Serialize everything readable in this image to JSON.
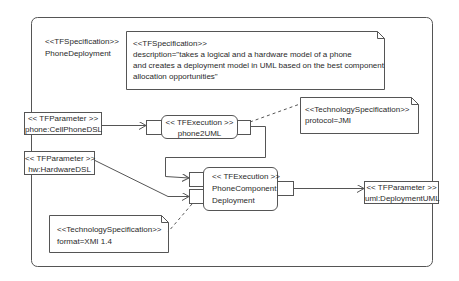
{
  "frame": {
    "stereotype": "<<TFSpecification>>",
    "name": "PhoneDeployment"
  },
  "description_note": {
    "stereotype": "<<TFSpecification>>",
    "lines": [
      "description=\"takes a logical and a hardware model of a phone",
      "and creates a deployment model in UML based on the best component",
      "allocation opportunities\""
    ]
  },
  "parameters": [
    {
      "stereotype": "<< TFParameter >>",
      "name": "phone:CellPhoneDSL"
    },
    {
      "stereotype": "<< TFParameter >>",
      "name": "hw:HardwareDSL"
    },
    {
      "stereotype": "<< TFParameter >>",
      "name": "uml:DeploymentUML"
    }
  ],
  "executions": [
    {
      "stereotype": "<< TFExecution >>",
      "lines": [
        "phone2UML"
      ]
    },
    {
      "stereotype": "<< TFExecution >>",
      "lines": [
        "PhoneComponent",
        "Deployment"
      ]
    }
  ],
  "tech_notes": [
    {
      "stereotype": "<<TechnologySpecification>>",
      "value": "protocol=JMI"
    },
    {
      "stereotype": "<<TechnologySpecification>>",
      "value": "format=XMI 1.4"
    }
  ],
  "colors": {
    "line": "#555555",
    "text": "#2a2a2a",
    "background": "#ffffff"
  }
}
